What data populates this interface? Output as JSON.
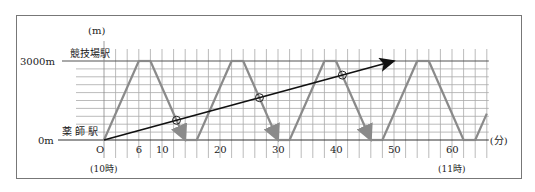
{
  "chart_data": {
    "type": "line",
    "title": "",
    "xlabel": "(分)",
    "ylabel": "(m)",
    "x_unit": "分",
    "y_unit": "m",
    "xlim": [
      0,
      66
    ],
    "ylim": [
      0,
      3000
    ],
    "x_ticks": [
      {
        "value": 0,
        "label": "O"
      },
      {
        "value": 6,
        "label": "6"
      },
      {
        "value": 10,
        "label": "10"
      },
      {
        "value": 20,
        "label": "20"
      },
      {
        "value": 30,
        "label": "30"
      },
      {
        "value": 40,
        "label": "40"
      },
      {
        "value": 50,
        "label": "50"
      },
      {
        "value": 60,
        "label": "60"
      }
    ],
    "x_annotations": [
      {
        "value": 0,
        "label": "(10時)"
      },
      {
        "value": 60,
        "label": "(11時)"
      }
    ],
    "y_ticks": [
      {
        "value": 0,
        "label": "0m",
        "station": "薬 師 駅"
      },
      {
        "value": 3000,
        "label": "3000m",
        "station": "競技場駅"
      }
    ],
    "grid": {
      "x_step_min": 2,
      "y_step_m": 300
    },
    "series": [
      {
        "name": "train",
        "color": "#8a8a8a",
        "points": [
          [
            0,
            0
          ],
          [
            6,
            3000
          ],
          [
            8,
            3000
          ],
          [
            14,
            0
          ],
          [
            16,
            0
          ],
          [
            22,
            3000
          ],
          [
            24,
            3000
          ],
          [
            30,
            0
          ],
          [
            32,
            0
          ],
          [
            38,
            3000
          ],
          [
            40,
            3000
          ],
          [
            46,
            0
          ],
          [
            48,
            0
          ],
          [
            54,
            3000
          ],
          [
            56,
            3000
          ],
          [
            62,
            0
          ],
          [
            64,
            0
          ],
          [
            66,
            1000
          ]
        ],
        "arrows_at": [
          [
            14,
            0
          ],
          [
            30,
            0
          ],
          [
            46,
            0
          ]
        ]
      },
      {
        "name": "walker",
        "color": "#111111",
        "points": [
          [
            0,
            0
          ],
          [
            50,
            3000
          ]
        ],
        "arrow_end": true
      }
    ],
    "intersections": [
      {
        "t": 12.5,
        "y": 750
      },
      {
        "t": 26.8,
        "y": 1607
      },
      {
        "t": 41.1,
        "y": 2464
      }
    ]
  },
  "labels": {
    "y_unit": "(m)",
    "x_unit": "(分)",
    "y_top": "3000m",
    "y_bottom": "0m",
    "station_top": "競技場駅",
    "station_bottom": "薬 師 駅",
    "origin": "O",
    "t10": "(10時)",
    "t11": "(11時)"
  }
}
